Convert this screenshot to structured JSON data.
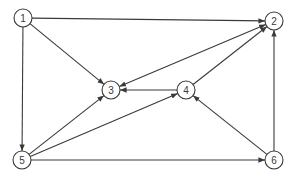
{
  "diagram": {
    "type": "directed-graph",
    "colors": {
      "stroke": "#3a3a3a",
      "background": "#ffffff",
      "node_fill": "#ffffff"
    },
    "node_radius": 9,
    "nodes": [
      {
        "id": "1",
        "label": "1",
        "x": 23,
        "y": 18
      },
      {
        "id": "2",
        "label": "2",
        "x": 274,
        "y": 21
      },
      {
        "id": "3",
        "label": "3",
        "x": 111,
        "y": 90
      },
      {
        "id": "4",
        "label": "4",
        "x": 186,
        "y": 90
      },
      {
        "id": "5",
        "label": "5",
        "x": 22,
        "y": 160
      },
      {
        "id": "6",
        "label": "6",
        "x": 274,
        "y": 160
      }
    ],
    "edges": [
      {
        "from": "1",
        "to": "2",
        "bidirectional": false
      },
      {
        "from": "1",
        "to": "3",
        "bidirectional": false
      },
      {
        "from": "1",
        "to": "5",
        "bidirectional": false
      },
      {
        "from": "2",
        "to": "3",
        "bidirectional": true
      },
      {
        "from": "4",
        "to": "3",
        "bidirectional": false
      },
      {
        "from": "4",
        "to": "2",
        "bidirectional": false
      },
      {
        "from": "5",
        "to": "3",
        "bidirectional": false
      },
      {
        "from": "5",
        "to": "4",
        "bidirectional": false
      },
      {
        "from": "5",
        "to": "6",
        "bidirectional": false
      },
      {
        "from": "6",
        "to": "4",
        "bidirectional": false
      },
      {
        "from": "6",
        "to": "2",
        "bidirectional": false
      }
    ]
  }
}
